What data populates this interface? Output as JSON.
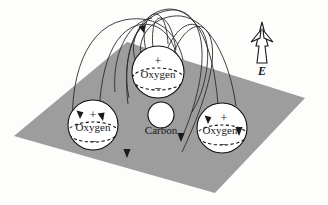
{
  "figure": {
    "name": "electric-field-polarized-co2-molecule",
    "background_color": "#fdfdfc",
    "plane": {
      "name": "dielectric-plane",
      "fill_color": "#9d9d9d",
      "points": "127,42 305,98 215,193 14,136"
    },
    "field_color": "#2b2b2b",
    "atoms": [
      {
        "id": "oxygen-left",
        "label": "Oxygen",
        "plus_sign": "+",
        "minus_sign": "–",
        "cx": 93,
        "cy": 125,
        "r": 25,
        "fill": "#ffffff"
      },
      {
        "id": "oxygen-center",
        "label": "Oxygen",
        "plus_sign": "+",
        "minus_sign": "–",
        "cx": 158,
        "cy": 72,
        "r": 26,
        "fill": "#ffffff"
      },
      {
        "id": "oxygen-right",
        "label": "Oxygen",
        "plus_sign": "+",
        "minus_sign": "–",
        "cx": 222,
        "cy": 128,
        "r": 25,
        "fill": "#ffffff"
      },
      {
        "id": "carbon-center",
        "label": "Carbon",
        "cx": 161,
        "cy": 115,
        "r": 13,
        "fill": "#ffffff"
      }
    ],
    "efield": {
      "name": "external-electric-field",
      "label": "E",
      "direction": "up",
      "style": "hollow-outlined-arrow"
    },
    "field_lines": [
      {
        "id": "line-1",
        "d": "M 74,140 C 70,92 80,30 125,20 C 162,12 178,36 182,58"
      },
      {
        "id": "line-2",
        "d": "M 99,143 C 96,94 104,34 138,25 C 163,19 175,42 177,60"
      },
      {
        "id": "line-3",
        "d": "M 145,48 C 140,30 146,16 154,14 C 163,13 168,24 168,42"
      },
      {
        "id": "line-4",
        "d": "M 152,46 C 150,28 154,18 160,18 C 167,19 172,30 175,48"
      },
      {
        "id": "line-5",
        "d": "M 135,60 C 126,36 146,10 168,9 C 196,9 212,44 217,102"
      },
      {
        "id": "line-6",
        "d": "M 141,58 C 134,34 156,14 180,16 C 208,19 228,56 235,104"
      },
      {
        "id": "line-7",
        "d": "M 128,97 C 121,55 136,14 170,10 C 204,8 214,60 180,138"
      },
      {
        "id": "line-8",
        "d": "M 172,52 C 184,24 204,18 210,40 C 216,62 200,110 181,150"
      }
    ],
    "downward_arrow_markers": [
      {
        "id": "arrow-plane-mid-left",
        "x": 127,
        "y": 155
      },
      {
        "id": "arrow-plane-mid-right",
        "x": 180,
        "y": 138
      }
    ]
  }
}
